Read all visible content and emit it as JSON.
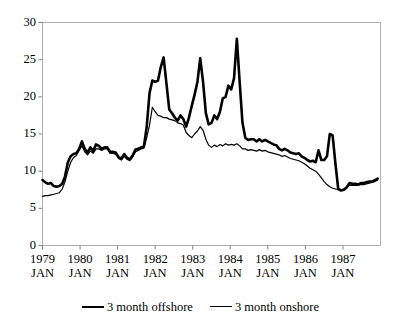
{
  "chart_data": {
    "type": "line",
    "title": "",
    "xlabel": "",
    "ylabel": "",
    "ylim": [
      0,
      30
    ],
    "yticks": [
      0,
      5,
      10,
      15,
      20,
      25,
      30
    ],
    "ytick_labels": [
      "0",
      "5",
      "10",
      "15",
      "20",
      "25",
      "30"
    ],
    "grid": false,
    "legend_position": "bottom-center",
    "x_tick_years": [
      "1979",
      "1980",
      "1981",
      "1982",
      "1983",
      "1984",
      "1985",
      "1986",
      "1987"
    ],
    "x_tick_month": "JAN",
    "x_tick_labels": [
      "1979 JAN",
      "1980 JAN",
      "1981 JAN",
      "1982 JAN",
      "1983 JAN",
      "1984 JAN",
      "1985 JAN",
      "1986 JAN",
      "1987 JAN"
    ],
    "x_start": "1979 JAN",
    "x_end": "1987 DEC",
    "x_frequency": "monthly",
    "series": [
      {
        "name": "3 month offshore",
        "line_style": "thick-solid",
        "color": "#000000",
        "line_width": 2.6,
        "values": [
          8.8,
          8.5,
          8.3,
          8.4,
          8.0,
          7.9,
          8.0,
          8.3,
          9.3,
          11.2,
          12.0,
          12.3,
          12.4,
          13.0,
          14.0,
          13.0,
          12.5,
          13.2,
          12.7,
          13.6,
          13.4,
          13.0,
          13.2,
          13.2,
          12.6,
          12.6,
          12.5,
          11.9,
          11.7,
          12.3,
          11.8,
          11.6,
          12.1,
          12.9,
          13.0,
          13.2,
          13.3,
          16.0,
          20.5,
          22.2,
          22.0,
          22.2,
          24.0,
          25.3,
          21.8,
          18.3,
          17.8,
          17.2,
          16.8,
          17.5,
          17.0,
          16.0,
          17.2,
          18.8,
          20.3,
          22.0,
          25.2,
          22.0,
          17.8,
          16.3,
          16.5,
          17.5,
          17.0,
          18.0,
          19.8,
          20.0,
          21.5,
          21.0,
          22.5,
          27.8,
          22.0,
          16.5,
          14.5,
          14.2,
          14.3,
          14.3,
          14.0,
          14.3,
          14.0,
          14.2,
          14.0,
          13.8,
          13.6,
          13.5,
          13.0,
          12.8,
          13.0,
          12.8,
          12.5,
          12.4,
          12.3,
          12.4,
          12.0,
          11.8,
          11.5,
          11.3,
          11.4,
          11.2,
          12.8,
          11.5,
          11.5,
          12.0,
          15.0,
          14.8,
          11.0,
          7.6,
          7.4,
          7.5,
          7.8,
          8.4,
          8.3,
          8.3,
          8.2,
          8.4,
          8.4,
          8.5,
          8.6,
          8.6,
          8.8,
          9.0
        ]
      },
      {
        "name": "3 month onshore",
        "line_style": "thin-solid",
        "color": "#000000",
        "line_width": 1.2,
        "values": [
          6.6,
          6.7,
          6.7,
          6.8,
          6.9,
          7.0,
          7.1,
          7.6,
          8.6,
          10.0,
          11.2,
          11.8,
          12.1,
          12.8,
          13.4,
          12.6,
          12.2,
          12.7,
          12.4,
          13.0,
          13.0,
          12.8,
          13.0,
          13.0,
          12.4,
          12.4,
          12.3,
          11.7,
          11.5,
          12.0,
          11.6,
          11.4,
          11.9,
          12.6,
          12.8,
          13.0,
          13.1,
          14.5,
          16.2,
          18.6,
          18.0,
          17.5,
          17.4,
          17.2,
          17.2,
          17.0,
          16.9,
          16.8,
          16.5,
          16.4,
          16.2,
          15.2,
          14.8,
          14.5,
          15.0,
          15.4,
          16.0,
          15.5,
          14.3,
          13.5,
          13.2,
          13.5,
          13.3,
          13.6,
          13.4,
          13.7,
          13.5,
          13.6,
          13.5,
          13.7,
          13.4,
          13.0,
          13.0,
          12.8,
          12.9,
          12.8,
          12.7,
          12.9,
          12.7,
          12.8,
          12.6,
          12.5,
          12.4,
          12.3,
          12.2,
          12.0,
          12.1,
          11.9,
          11.7,
          11.6,
          11.5,
          11.4,
          11.2,
          11.0,
          10.7,
          10.4,
          10.2,
          10.0,
          9.6,
          9.1,
          8.6,
          8.2,
          7.9,
          7.7,
          7.6,
          7.5,
          7.5,
          7.6,
          7.9,
          8.1,
          8.1,
          8.1,
          8.1,
          8.2,
          8.2,
          8.3,
          8.4,
          8.5,
          8.6,
          8.8
        ]
      }
    ]
  },
  "legend": {
    "entries": [
      {
        "label": "3 month offshore",
        "style": "thick"
      },
      {
        "label": "3 month onshore",
        "style": "thin"
      }
    ]
  }
}
